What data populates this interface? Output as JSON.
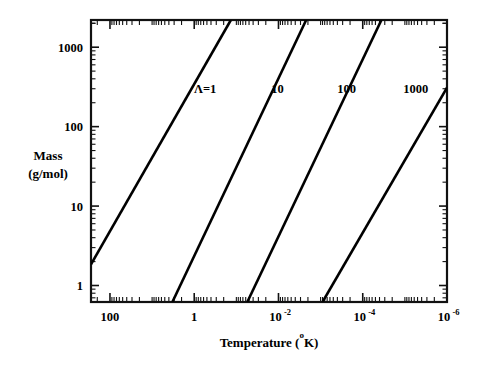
{
  "chart_data": {
    "type": "line",
    "title": "",
    "xlabel": "Temperature (°K)",
    "ylabel": "Mass (g/mol)",
    "xlabel_main": "Temperature (",
    "xlabel_sup": "o",
    "xlabel_tail": "K)",
    "ylabel_line1": "Mass",
    "ylabel_line2": "(g/mol)",
    "xscale": "log",
    "yscale": "log",
    "x_direction": "decreasing",
    "xlim": [
      282.0,
      1e-06
    ],
    "ylim": [
      0.62,
      2200
    ],
    "grid": false,
    "legend": "inline-annotations",
    "xticks": [
      {
        "value": 100,
        "label": "100",
        "mantissa": "100",
        "exponent": ""
      },
      {
        "value": 1,
        "label": "1",
        "mantissa": "1",
        "exponent": ""
      },
      {
        "value": 0.01,
        "label": "10-2",
        "mantissa": "10",
        "exponent": "-2"
      },
      {
        "value": 0.0001,
        "label": "10-4",
        "mantissa": "10",
        "exponent": "-4"
      },
      {
        "value": 1e-06,
        "label": "10-6",
        "mantissa": "10",
        "exponent": "-6"
      }
    ],
    "yticks": [
      {
        "value": 1,
        "label": "1"
      },
      {
        "value": 10,
        "label": "10"
      },
      {
        "value": 100,
        "label": "100"
      },
      {
        "value": 1000,
        "label": "1000"
      }
    ],
    "series": [
      {
        "name": "Lambda=1",
        "label": "Λ=1",
        "label_x": 0.55,
        "label_y": 300,
        "x": [
          282.0,
          0.135
        ],
        "y": [
          1.85,
          2200
        ],
        "color": "#000000"
      },
      {
        "name": "Lambda=10",
        "label": "10",
        "label_x": 0.0105,
        "label_y": 300,
        "x": [
          3.3,
          0.0022
        ],
        "y": [
          0.62,
          2200
        ],
        "color": "#000000"
      },
      {
        "name": "Lambda=100",
        "label": "100",
        "label_x": 0.00024,
        "label_y": 300,
        "x": [
          0.055,
          3.6e-05
        ],
        "y": [
          0.62,
          2200
        ],
        "color": "#000000"
      },
      {
        "name": "Lambda=1000",
        "label": "1000",
        "label_x": 5.5e-06,
        "label_y": 300,
        "x": [
          0.0009,
          1e-06
        ],
        "y": [
          0.62,
          310
        ],
        "color": "#000000"
      }
    ]
  },
  "axes": {
    "frame_color": "#111111",
    "background": "#ffffff"
  }
}
